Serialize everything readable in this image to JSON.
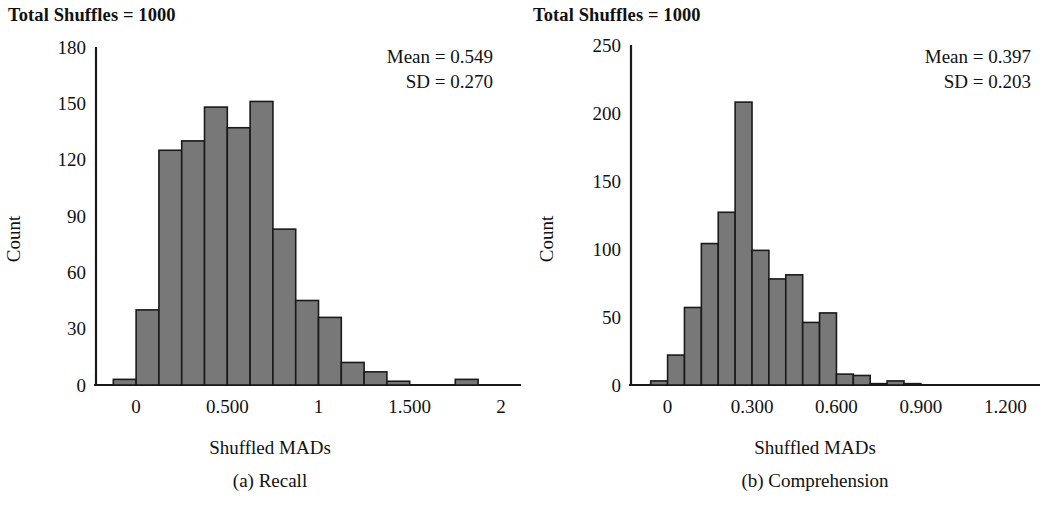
{
  "panels": [
    {
      "title": "Total Shuffles = 1000",
      "stats": {
        "mean_line": "Mean = 0.549",
        "sd_line": "SD = 0.270"
      },
      "ylabel": "Count",
      "xlabel": "Shuffled MADs",
      "caption": "(a) Recall"
    },
    {
      "title": "Total Shuffles = 1000",
      "stats": {
        "mean_line": "Mean = 0.397",
        "sd_line": "SD = 0.203"
      },
      "ylabel": "Count",
      "xlabel": "Shuffled MADs",
      "caption": "(b) Comprehension"
    }
  ],
  "style": {
    "bar_fill": "#787878",
    "bar_stroke": "#1a1a1a",
    "axis_color": "#1a1a1a",
    "text_color": "#111111"
  },
  "chart_data": [
    {
      "type": "bar",
      "title": "Total Shuffles = 1000",
      "subtitle": "(a) Recall",
      "xlabel": "Shuffled MADs",
      "ylabel": "Count",
      "grid": false,
      "legend": "none",
      "annotations": [
        "Mean = 0.549",
        "SD = 0.270"
      ],
      "mean": 0.549,
      "sd": 0.27,
      "total_shuffles": 1000,
      "xlim": [
        -0.22,
        2.05
      ],
      "ylim": [
        0,
        180
      ],
      "ytick_values": [
        0,
        30,
        60,
        90,
        120,
        150,
        180
      ],
      "ytick_labels": [
        "0",
        "30",
        "60",
        "90",
        "120",
        "150",
        "180"
      ],
      "xtick_values": [
        0,
        0.5,
        1,
        1.5,
        2
      ],
      "xtick_labels": [
        "0",
        "0.500",
        "1",
        "1.500",
        "2"
      ],
      "bin_width": 0.125,
      "bin_starts": [
        -0.125,
        0.0,
        0.125,
        0.25,
        0.375,
        0.5,
        0.625,
        0.75,
        0.875,
        1.0,
        1.125,
        1.25,
        1.375,
        1.5,
        1.625,
        1.75
      ],
      "categories": [
        "-0.125",
        "0.000",
        "0.125",
        "0.250",
        "0.375",
        "0.500",
        "0.625",
        "0.750",
        "0.875",
        "1.000",
        "1.125",
        "1.250",
        "1.375",
        "1.500",
        "1.625",
        "1.750"
      ],
      "values": [
        3,
        40,
        125,
        130,
        148,
        137,
        151,
        83,
        45,
        36,
        12,
        7,
        2,
        0,
        0,
        3
      ]
    },
    {
      "type": "bar",
      "title": "Total Shuffles = 1000",
      "subtitle": "(b) Comprehension",
      "xlabel": "Shuffled MADs",
      "ylabel": "Count",
      "grid": false,
      "legend": "none",
      "annotations": [
        "Mean = 0.397",
        "SD = 0.203"
      ],
      "mean": 0.397,
      "sd": 0.203,
      "total_shuffles": 1000,
      "xlim": [
        -0.13,
        1.27
      ],
      "ylim": [
        0,
        250
      ],
      "ytick_values": [
        0,
        50,
        100,
        150,
        200,
        250
      ],
      "ytick_labels": [
        "0",
        "50",
        "100",
        "150",
        "200",
        "250"
      ],
      "xtick_values": [
        0,
        0.3,
        0.6,
        0.9,
        1.2
      ],
      "xtick_labels": [
        "0",
        "0.300",
        "0.600",
        "0.900",
        "1.200"
      ],
      "bin_width": 0.06,
      "bin_starts": [
        -0.06,
        0.0,
        0.06,
        0.12,
        0.18,
        0.24,
        0.3,
        0.36,
        0.42,
        0.48,
        0.54,
        0.6,
        0.66,
        0.72,
        0.78,
        0.84,
        0.9,
        0.96,
        1.02,
        1.08
      ],
      "categories": [
        "-0.06",
        "0.00",
        "0.06",
        "0.12",
        "0.18",
        "0.24",
        "0.30",
        "0.36",
        "0.42",
        "0.48",
        "0.54",
        "0.60",
        "0.66",
        "0.72",
        "0.78",
        "0.84",
        "0.90",
        "0.96",
        "1.02",
        "1.08"
      ],
      "values": [
        3,
        22,
        57,
        104,
        127,
        208,
        99,
        78,
        81,
        46,
        53,
        8,
        7,
        1,
        3,
        1,
        0,
        0,
        0,
        0
      ]
    }
  ]
}
